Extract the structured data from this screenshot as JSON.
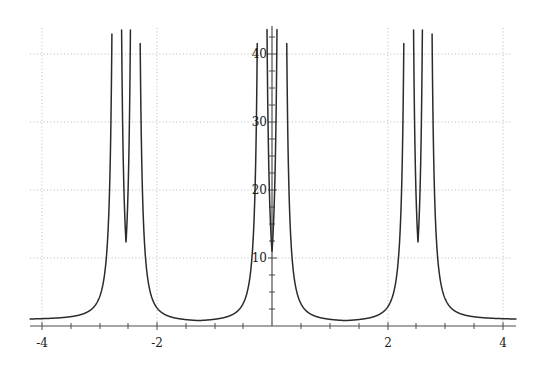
{
  "chart_data": {
    "type": "line",
    "title": "",
    "subtitle": "",
    "xlabel": "",
    "ylabel": "",
    "xlim": [
      -4.3,
      4.3
    ],
    "ylim": [
      0,
      47
    ],
    "grid": true,
    "grid_style": "dotted",
    "legend": "none",
    "background": "#ffffff",
    "line_color": "#2b2b2b",
    "axis_color": "#555555",
    "grid_color": "#bbbbbb",
    "xticks": [
      -4,
      -2,
      2,
      4
    ],
    "xtick_labels": [
      "-4",
      "-2",
      "2",
      "4"
    ],
    "yticks": [
      10,
      20,
      30,
      40
    ],
    "ytick_labels": [
      "10",
      "20",
      "30",
      "40"
    ],
    "minor_ticks": true,
    "asymptotes": [
      -2.69,
      -2.37,
      -0.17,
      0.17,
      2.37,
      2.69
    ],
    "minima_x": [
      -3.85,
      -1.5,
      1.5,
      3.85
    ],
    "minima_y": [
      0.9,
      0.55,
      0.55,
      0.9
    ],
    "period": 3.1416,
    "series": [
      {
        "name": "curve",
        "x": [
          -4.3,
          -4.2,
          -4.1,
          -4.0,
          -3.9,
          -3.8,
          -3.7,
          -3.6,
          -3.5,
          -3.4,
          -3.3,
          -3.2,
          -3.1,
          -3.0,
          -2.95,
          -2.9,
          -2.85,
          -2.8,
          -2.78,
          -2.76,
          -2.74,
          -2.72,
          -2.7
        ],
        "y": [
          1.2,
          1.1,
          1.0,
          0.95,
          0.9,
          0.9,
          0.95,
          1.05,
          1.2,
          1.5,
          1.9,
          2.5,
          3.4,
          5.0,
          6.3,
          8.2,
          11.5,
          17.5,
          21.5,
          27.5,
          34.5,
          42.0,
          47.0
        ]
      }
    ]
  },
  "axes": {
    "x_axis_name": "horizontal-axis",
    "y_axis_name": "vertical-axis"
  }
}
